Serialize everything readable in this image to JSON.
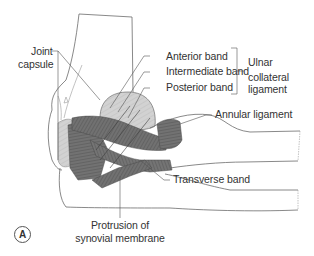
{
  "figure": {
    "panel_label": "A",
    "colors": {
      "outline": "#6b6b6b",
      "ligament_dark": "#6e6e6e",
      "ligament_fiber": "#4a4a4a",
      "capsule_light": "#cfcfcf",
      "label_text": "#333333",
      "leader_line": "#555555"
    }
  },
  "labels": {
    "joint_capsule": [
      "Joint",
      "capsule"
    ],
    "anterior_band": "Anterior band",
    "intermediate_band": "Intermediate band",
    "posterior_band": "Posterior band",
    "ulnar_collateral_ligament": [
      "Ulnar",
      "collateral",
      "ligament"
    ],
    "annular_ligament": "Annular ligament",
    "transverse_band": "Transverse band",
    "protrusion": [
      "Protrusion of",
      "synovial membrane"
    ]
  }
}
